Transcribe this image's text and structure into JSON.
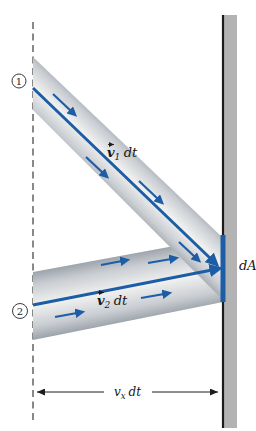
{
  "diagram": {
    "station1": "1",
    "station2": "2",
    "tube1_label": {
      "v": "v",
      "sub": "1",
      "dt": "dt"
    },
    "tube2_label": {
      "v": "v",
      "sub": "2",
      "dt": "dt"
    },
    "dA_label": "dA",
    "dimension_label": {
      "v": "v",
      "sub": "x",
      "dt": "dt"
    }
  },
  "colors": {
    "accent_blue": "#1d5da6",
    "wall_gray": "#b3b3b3",
    "tube_edge_gray": "#9aa1a8",
    "tube_center_gray": "#f1f1f0",
    "line_black": "#1c1c1c"
  }
}
